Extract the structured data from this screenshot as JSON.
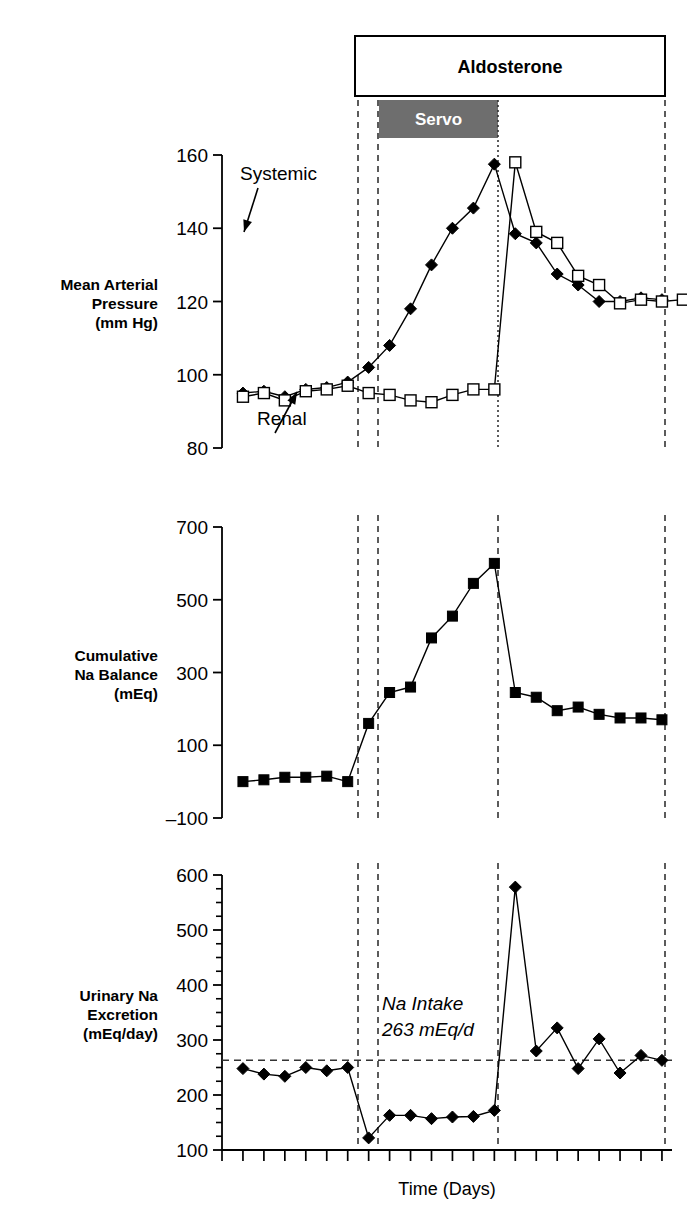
{
  "figure": {
    "width": 687,
    "height": 1212,
    "background": "#ffffff",
    "ink": "#000000",
    "servo_fill": "#6e6e6e"
  },
  "treatment_box": {
    "label": "Aldosterone",
    "x_start_px": 355,
    "x_end_px": 665,
    "y_top_px": 36,
    "y_bottom_px": 96
  },
  "servo_bar": {
    "label": "Servo",
    "x_start_px": 379,
    "x_end_px": 498,
    "y_top_px": 100,
    "y_bottom_px": 138,
    "fill": "#6e6e6e",
    "text_color": "#ffffff"
  },
  "event_lines": [
    {
      "name": "aldosterone-start",
      "x_px": 358,
      "style": "dashed"
    },
    {
      "name": "servo-start",
      "x_px": 378,
      "style": "dashed"
    },
    {
      "name": "servo-end",
      "x_px": 498,
      "style": "dashed"
    },
    {
      "name": "aldosterone-end",
      "x_px": 665,
      "style": "dashed"
    }
  ],
  "x_axis": {
    "label": "Time (Days)",
    "tick_count": 21,
    "first_tick_px": 222,
    "tick_spacing_px": 20.95,
    "axis_y_px": 1150,
    "plot_left_px": 222,
    "plot_right_px": 672
  },
  "chart_data": [
    {
      "type": "line",
      "panel": "top",
      "title": "",
      "ylabel": "Mean Arterial\nPressure\n(mm Hg)",
      "ylabel_lines": [
        "Mean Arterial",
        "Pressure",
        "(mm Hg)"
      ],
      "xlabel": "",
      "ylim": [
        80,
        160
      ],
      "yticks": [
        80,
        100,
        120,
        140,
        160
      ],
      "ytick_labels": [
        "80",
        "100",
        "120",
        "140",
        "160"
      ],
      "grid": false,
      "legend_position": "inline-annotation",
      "annotations": [
        {
          "text": "Systemic",
          "x_px": 240,
          "y_px": 180,
          "arrow_to_x_px": 244,
          "arrow_to_y_px": 232
        },
        {
          "text": "Renal",
          "x_px": 257,
          "y_px": 425,
          "arrow_to_x_px": 297,
          "arrow_to_y_px": 392
        }
      ],
      "x": [
        1,
        2,
        3,
        4,
        5,
        6,
        7,
        8,
        9,
        10,
        11,
        12,
        13,
        14,
        15,
        16,
        17,
        18,
        19,
        20,
        21
      ],
      "series": [
        {
          "name": "Systemic",
          "marker": "filled-diamond",
          "values": [
            95,
            95.5,
            94,
            96,
            96.5,
            98,
            102,
            108,
            118,
            130,
            140,
            145.5,
            157.5,
            138.5,
            136,
            127.5,
            124.5,
            120,
            120,
            121,
            120.5
          ]
        },
        {
          "name": "Renal",
          "marker": "open-square",
          "values": [
            94,
            95,
            93,
            95.5,
            96,
            97,
            95,
            94.5,
            93,
            92.5,
            94.5,
            96,
            96,
            158,
            139,
            136,
            127,
            124.5,
            119.5,
            120.5,
            120,
            120.5
          ]
        }
      ]
    },
    {
      "type": "line",
      "panel": "middle",
      "title": "",
      "ylabel": "Cumulative\nNa Balance\n(mEq)",
      "ylabel_lines": [
        "Cumulative",
        "Na Balance",
        "(mEq)"
      ],
      "xlabel": "",
      "ylim": [
        -100,
        700
      ],
      "yticks": [
        -100,
        100,
        300,
        500,
        700
      ],
      "ytick_labels": [
        "–100",
        "100",
        "300",
        "500",
        "700"
      ],
      "grid": false,
      "legend_position": "none",
      "x": [
        1,
        2,
        3,
        4,
        5,
        6,
        7,
        8,
        9,
        10,
        11,
        12,
        13,
        14,
        15,
        16,
        17,
        18,
        19,
        20,
        21
      ],
      "series": [
        {
          "name": "Cumulative Na Balance",
          "marker": "filled-square",
          "values": [
            0,
            5,
            12,
            12,
            15,
            0,
            160,
            245,
            260,
            395,
            455,
            545,
            600,
            245,
            232,
            195,
            205,
            185,
            175,
            175,
            170
          ]
        }
      ]
    },
    {
      "type": "line",
      "panel": "bottom",
      "title": "",
      "ylabel": "Urinary Na\nExcretion\n(mEq/day)",
      "ylabel_lines": [
        "Urinary Na",
        "Excretion",
        "(mEq/day)"
      ],
      "xlabel": "Time (Days)",
      "ylim": [
        100,
        600
      ],
      "yticks": [
        100,
        200,
        300,
        400,
        500,
        600
      ],
      "ytick_labels": [
        "100",
        "200",
        "300",
        "400",
        "500",
        "600"
      ],
      "minor_tick_step": 25,
      "grid": false,
      "legend_position": "none",
      "reference_line": {
        "name": "Na Intake",
        "value": 263,
        "label_lines": [
          "Na Intake",
          "263 mEq/d"
        ],
        "style": "dashed",
        "label_x_px": 382,
        "label_y_px": 1010
      },
      "x": [
        1,
        2,
        3,
        4,
        5,
        6,
        7,
        8,
        9,
        10,
        11,
        12,
        13,
        14,
        15,
        16,
        17,
        18,
        19,
        20,
        21
      ],
      "series": [
        {
          "name": "Urinary Na Excretion",
          "marker": "filled-diamond",
          "values": [
            248,
            238,
            234,
            250,
            244,
            250,
            122,
            163,
            163,
            157,
            160,
            161,
            172,
            578,
            280,
            322,
            248,
            302,
            240,
            272,
            263
          ]
        }
      ]
    }
  ]
}
